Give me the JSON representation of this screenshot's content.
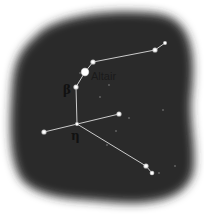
{
  "colors": {
    "sky": "#2a2a2a",
    "background": "#ffffff",
    "line": "#dcdcdc",
    "star": "#ffffff",
    "label": "#111111"
  },
  "labels": {
    "altair": "Altair",
    "beta": "β",
    "eta": "η"
  },
  "stars": [
    {
      "name": "Altair",
      "x": 85,
      "y": 72,
      "r": 3.4
    },
    {
      "name": "gamma",
      "x": 93,
      "y": 62,
      "r": 1.8
    },
    {
      "name": "beta",
      "x": 76,
      "y": 87,
      "r": 1.8
    },
    {
      "name": "eta",
      "x": 77,
      "y": 124,
      "r": 1.2
    },
    {
      "name": "theta",
      "x": 119,
      "y": 114,
      "r": 1.8
    },
    {
      "name": "delta",
      "x": 44,
      "y": 132,
      "r": 1.8
    },
    {
      "name": "zeta",
      "x": 155,
      "y": 50,
      "r": 1.8
    },
    {
      "name": "epsilon",
      "x": 165,
      "y": 43,
      "r": 1.2
    },
    {
      "name": "lambda",
      "x": 146,
      "y": 166,
      "r": 1.8
    },
    {
      "name": "iota",
      "x": 152,
      "y": 173,
      "r": 1.5
    }
  ],
  "faint_stars": [
    {
      "x": 109,
      "y": 85
    },
    {
      "x": 80,
      "y": 73
    },
    {
      "x": 163,
      "y": 110
    },
    {
      "x": 116,
      "y": 131
    },
    {
      "x": 159,
      "y": 173
    },
    {
      "x": 175,
      "y": 166
    },
    {
      "x": 100,
      "y": 97
    },
    {
      "x": 129,
      "y": 118
    },
    {
      "x": 107,
      "y": 145
    }
  ],
  "lines": [
    [
      165,
      43,
      155,
      50
    ],
    [
      155,
      50,
      93,
      62
    ],
    [
      93,
      62,
      85,
      72
    ],
    [
      85,
      72,
      76,
      87
    ],
    [
      76,
      87,
      77,
      124
    ],
    [
      44,
      132,
      119,
      114
    ],
    [
      77,
      124,
      146,
      166
    ],
    [
      146,
      166,
      152,
      173
    ]
  ]
}
